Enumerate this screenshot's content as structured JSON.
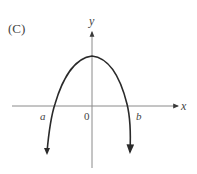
{
  "figure": {
    "panel_label": "(C)",
    "axes": {
      "x_label": "x",
      "y_label": "y",
      "origin_label": "0"
    },
    "points": {
      "a_label": "a",
      "b_label": "b"
    },
    "curve": {
      "type": "downward-opening parabola",
      "description": "Concave-down curve with maximum on positive y-axis, crossing x-axis at a (negative) and b (positive), both ends continuing downward with arrows"
    },
    "colors": {
      "axis": "#8a8a8a",
      "curve": "#2a2a2a",
      "text": "#444444"
    }
  }
}
